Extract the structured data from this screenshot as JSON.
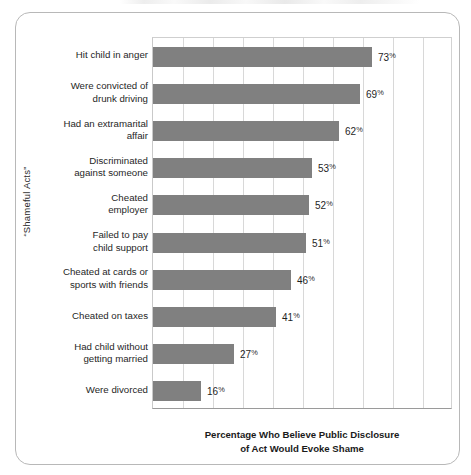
{
  "chart_data": {
    "type": "bar",
    "orientation": "horizontal",
    "title": "",
    "xlabel": "Percentage Who Believe Public Disclosure of Act Would Evoke Shame",
    "xlabel_lines": [
      "Percentage Who Believe Public Disclosure",
      "of Act Would Evoke Shame"
    ],
    "ylabel": "“Shameful Acts”",
    "categories": [
      "Hit child in anger",
      "Were convicted of drunk driving",
      "Had an extramarital affair",
      "Discriminated against someone",
      "Cheated employer",
      "Failed to pay child support",
      "Cheated at cards or sports with friends",
      "Cheated on taxes",
      "Had child without getting married",
      "Were divorced"
    ],
    "category_lines": [
      [
        "Hit child in anger"
      ],
      [
        "Were convicted of",
        "drunk driving"
      ],
      [
        "Had an extramarital",
        "affair"
      ],
      [
        "Discriminated",
        "against someone"
      ],
      [
        "Cheated",
        "employer"
      ],
      [
        "Failed to pay",
        "child support"
      ],
      [
        "Cheated at cards or",
        "sports with friends"
      ],
      [
        "Cheated on taxes"
      ],
      [
        "Had child without",
        "getting married"
      ],
      [
        "Were divorced"
      ]
    ],
    "values": [
      73,
      69,
      62,
      53,
      52,
      51,
      46,
      41,
      27,
      16
    ],
    "value_labels": [
      "73%",
      "69%",
      "62%",
      "53%",
      "52%",
      "51%",
      "46%",
      "41%",
      "27%",
      "16%"
    ],
    "value_numbers": [
      "73",
      "69",
      "62",
      "53",
      "52",
      "51",
      "46",
      "41",
      "27",
      "16"
    ],
    "percent_symbol": "%",
    "xlim": [
      0,
      100
    ],
    "gridlines": [
      10,
      20,
      30,
      40,
      50,
      60,
      70,
      80,
      90
    ],
    "grid": true,
    "legend": "none",
    "bar_color": "#808080",
    "grid_color": "#d8d8d8",
    "axis_color": "#9a9a9a",
    "text_color": "#1f1f1f"
  }
}
